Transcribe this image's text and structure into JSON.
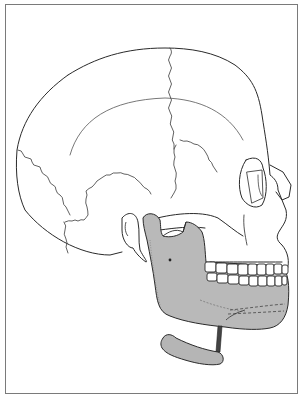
{
  "figure": {
    "caption": "",
    "colors": {
      "line": "#2a2a2a",
      "suture": "#3a3a3a",
      "mandible_fill": "#b9b9b9",
      "hyoid_fill": "#b5b5b5",
      "frame": "#7a7a7a",
      "background": "#ffffff"
    },
    "labels": {
      "cranium": "cranium",
      "mandible": "mandible",
      "hyoid": "hyoid bone",
      "teeth": "teeth",
      "orbit": "orbit",
      "nasal": "nasal bone",
      "mastoid": "mastoid process",
      "styloid_ligament": "stylohyoid ligament"
    }
  }
}
